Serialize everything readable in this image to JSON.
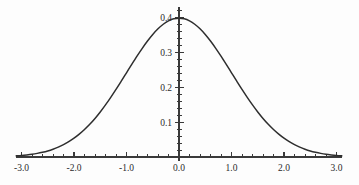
{
  "chart_data": {
    "type": "line",
    "title": "",
    "subtitle": "",
    "xlabel": "",
    "ylabel": "",
    "xlim": [
      -3.1,
      3.1
    ],
    "ylim": [
      0,
      0.43
    ],
    "grid": false,
    "legend": null,
    "annotations": [],
    "x_axis": {
      "major_ticks": [
        -3.0,
        -2.0,
        -1.0,
        0.0,
        1.0,
        2.0,
        3.0
      ],
      "major_tick_labels": [
        "-3.0",
        "-2.0",
        "-1.0",
        "0.0",
        "1.0",
        "2.0",
        "3.0"
      ],
      "minor_tick_step": 0.2,
      "axis_position_y": 0.0
    },
    "y_axis": {
      "major_ticks": [
        0.1,
        0.2,
        0.3,
        0.4
      ],
      "major_tick_labels": [
        "0.1",
        "0.2",
        "0.3",
        "0.4"
      ],
      "minor_tick_step": 0.02,
      "axis_position_x": 0.0
    },
    "series": [
      {
        "name": "standard normal pdf",
        "color": "#2e2e2e",
        "x": [
          -3.1,
          -3.0,
          -2.9,
          -2.8,
          -2.7,
          -2.6,
          -2.5,
          -2.4,
          -2.3,
          -2.2,
          -2.1,
          -2.0,
          -1.9,
          -1.8,
          -1.7,
          -1.6,
          -1.5,
          -1.4,
          -1.3,
          -1.2,
          -1.1,
          -1.0,
          -0.9,
          -0.8,
          -0.7,
          -0.6,
          -0.5,
          -0.4,
          -0.3,
          -0.2,
          -0.1,
          0.0,
          0.1,
          0.2,
          0.3,
          0.4,
          0.5,
          0.6,
          0.7,
          0.8,
          0.9,
          1.0,
          1.1,
          1.2,
          1.3,
          1.4,
          1.5,
          1.6,
          1.7,
          1.8,
          1.9,
          2.0,
          2.1,
          2.2,
          2.3,
          2.4,
          2.5,
          2.6,
          2.7,
          2.8,
          2.9,
          3.0,
          3.1
        ],
        "y": [
          0.0033,
          0.0044,
          0.006,
          0.0079,
          0.0104,
          0.0136,
          0.0175,
          0.0224,
          0.0283,
          0.0355,
          0.044,
          0.054,
          0.0656,
          0.079,
          0.094,
          0.1109,
          0.1295,
          0.1497,
          0.1714,
          0.1942,
          0.2179,
          0.242,
          0.2661,
          0.2897,
          0.3123,
          0.3332,
          0.3521,
          0.3683,
          0.3814,
          0.391,
          0.397,
          0.3989,
          0.397,
          0.391,
          0.3814,
          0.3683,
          0.3521,
          0.3332,
          0.3123,
          0.2897,
          0.2661,
          0.242,
          0.2179,
          0.1942,
          0.1714,
          0.1497,
          0.1295,
          0.1109,
          0.094,
          0.079,
          0.0656,
          0.054,
          0.044,
          0.0355,
          0.0283,
          0.0224,
          0.0175,
          0.0136,
          0.0104,
          0.0079,
          0.006,
          0.0044,
          0.0033
        ]
      }
    ]
  },
  "plot": {
    "background_color": "#fdfdfd",
    "axis_color": "#3a3a3a",
    "curve_color": "#2e2e2e",
    "label_color": "#2b2b2b"
  }
}
